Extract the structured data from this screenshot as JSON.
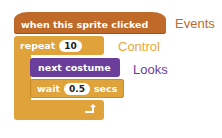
{
  "blocks": {
    "hat": {
      "text": "when this sprite clicked",
      "color": "#c06a2a"
    },
    "repeat": {
      "label": "repeat",
      "count": "10",
      "color": "#e0a23a"
    },
    "looks": {
      "text": "next costume",
      "color": "#6a3e9a"
    },
    "wait": {
      "label": "wait",
      "value": "0.5",
      "unit": "secs",
      "color": "#e0a23a"
    },
    "loop_arrow": "↰"
  },
  "labels": {
    "events": {
      "text": "Events",
      "color": "#c06a2a"
    },
    "control": {
      "text": "Control",
      "color": "#e8a838"
    },
    "looks": {
      "text": "Looks",
      "color": "#6a3e9a"
    }
  }
}
